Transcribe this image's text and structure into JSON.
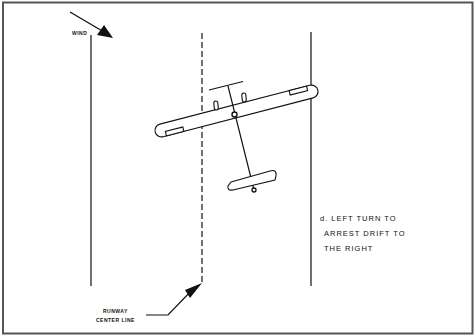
{
  "diagram": {
    "wind_label": "WIND",
    "centerline_label_line1": "RUNWAY",
    "centerline_label_line2": "CENTER LINE",
    "caption_line1": "d. LEFT TURN TO",
    "caption_line2": "ARREST DRIFT TO",
    "caption_line3": "THE RIGHT"
  },
  "colors": {
    "background": "#ffffff",
    "ink": "#111111",
    "border": "#555555"
  }
}
